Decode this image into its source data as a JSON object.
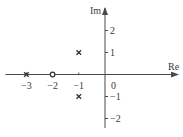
{
  "diagram": {
    "type": "pole-zero-plot",
    "axes": {
      "x_label": "Re",
      "y_label": "Im",
      "x_ticks": [
        {
          "value": -3,
          "label": "−3"
        },
        {
          "value": -2,
          "label": "−2"
        },
        {
          "value": -1,
          "label": "−1"
        }
      ],
      "origin_label": "0",
      "y_ticks": [
        {
          "value": 2,
          "label": "2"
        },
        {
          "value": 1,
          "label": "1"
        },
        {
          "value": -1,
          "label": "−1"
        },
        {
          "value": -2,
          "label": "−2"
        }
      ],
      "x_range": [
        -3.8,
        2.7
      ],
      "y_range": [
        -2.4,
        3.0
      ]
    },
    "poles": [
      {
        "re": -3,
        "im": 0
      },
      {
        "re": -1,
        "im": 1
      },
      {
        "re": -1,
        "im": -1
      }
    ],
    "zeros": [
      {
        "re": -2,
        "im": 0
      }
    ]
  }
}
